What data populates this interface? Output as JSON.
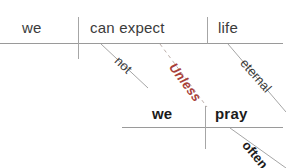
{
  "diagram": {
    "type": "reed-kellogg-sentence-diagram",
    "sentence": "We can not expect life eternal unless we pray often.",
    "background_color": "#ffffff",
    "line_color": "#9a9a9a",
    "text_color": "#3b3b3b",
    "accent_color": "#a8413a",
    "clauses": {
      "main": {
        "subject": "we",
        "predicate": "can expect",
        "object": "life",
        "modifiers": [
          {
            "label": "not",
            "attached_to": "can expect"
          },
          {
            "label": "eternal",
            "attached_to": "life"
          }
        ]
      },
      "subordinate": {
        "conjunction": "Unless",
        "subject": "we",
        "predicate": "pray",
        "modifiers": [
          {
            "label": "often",
            "attached_to": "pray"
          }
        ]
      }
    }
  },
  "labels": {
    "we_top": "we",
    "can_expect": "can expect",
    "life": "life",
    "not": "not",
    "eternal": "eternal",
    "unless": "Unless",
    "we_bottom": "we",
    "pray": "pray",
    "often": "often"
  }
}
